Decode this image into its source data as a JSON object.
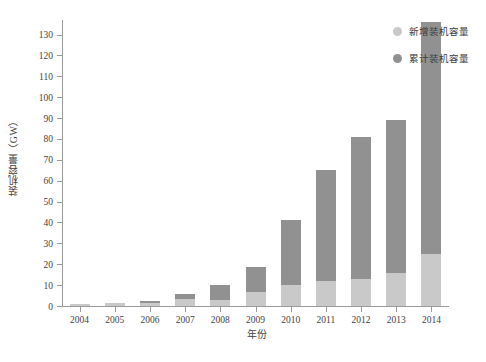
{
  "chart_data": {
    "type": "bar",
    "stacked": true,
    "title": "",
    "xlabel": "年份",
    "ylabel": "装机容量（GW）",
    "categories": [
      "2004",
      "2005",
      "2006",
      "2007",
      "2008",
      "2009",
      "2010",
      "2011",
      "2012",
      "2013",
      "2014"
    ],
    "x": [
      2004,
      2005,
      2006,
      2007,
      2008,
      2009,
      2010,
      2011,
      2012,
      2013,
      2014
    ],
    "series": [
      {
        "name": "新增装机容量",
        "color": "#c9c9c9",
        "values": [
          0.8,
          1.3,
          1.6,
          3.3,
          3.1,
          6.5,
          10.0,
          12.0,
          13.0,
          16.0,
          25.0
        ]
      },
      {
        "name": "累计装机容量",
        "color": "#919191",
        "values": [
          0.8,
          1.3,
          2.6,
          5.9,
          10.0,
          18.5,
          41.0,
          65.0,
          81.0,
          89.0,
          108.0
        ]
      }
    ],
    "cumulative_totals": [
      0.8,
      1.3,
      2.6,
      5.9,
      10.0,
      18.5,
      41.0,
      65.0,
      81.0,
      89.0,
      136.0
    ],
    "ylim": [
      0,
      137
    ],
    "ytick_values": [
      0,
      10,
      20,
      30,
      40,
      50,
      60,
      70,
      80,
      90,
      100,
      110,
      120,
      130
    ],
    "ytick_labels": [
      "0",
      "10",
      "20",
      "30",
      "40",
      "50",
      "60",
      "70",
      "80",
      "90",
      "100",
      "110",
      "120",
      "130"
    ],
    "grid": false,
    "legend_position": "top-right",
    "legend": [
      {
        "label": "新增装机容量",
        "color": "#c9c9c9",
        "marker": "circle"
      },
      {
        "label": "累计装机容量",
        "color": "#919191",
        "marker": "circle"
      }
    ],
    "axis_color": "#9a9a9a",
    "background": "#ffffff"
  }
}
